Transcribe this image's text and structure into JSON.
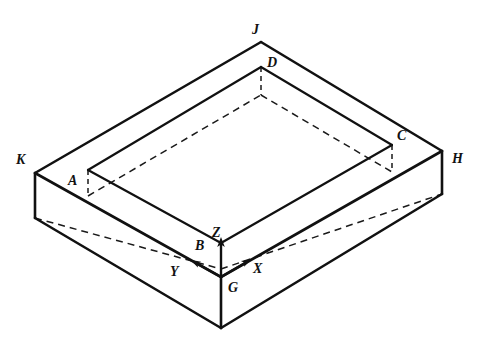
{
  "figure": {
    "kind": "isometric-line-drawing",
    "background_color": "#ffffff",
    "line_color": "#111111",
    "hidden_line_style": "dashed"
  },
  "vertex_labels": [
    {
      "id": "J",
      "text": "J",
      "x": 252,
      "y": 23
    },
    {
      "id": "D",
      "text": "D",
      "x": 267,
      "y": 56
    },
    {
      "id": "C",
      "text": "C",
      "x": 397,
      "y": 129
    },
    {
      "id": "H",
      "text": "H",
      "x": 452,
      "y": 152
    },
    {
      "id": "K",
      "text": "K",
      "x": 16,
      "y": 153
    },
    {
      "id": "A",
      "text": "A",
      "x": 68,
      "y": 174
    },
    {
      "id": "Z",
      "text": "Z",
      "x": 212,
      "y": 226
    },
    {
      "id": "B",
      "text": "B",
      "x": 195,
      "y": 239
    },
    {
      "id": "G",
      "text": "G",
      "x": 228,
      "y": 281
    }
  ],
  "axis_labels": [
    {
      "id": "X",
      "text": "X",
      "x": 253,
      "y": 262
    },
    {
      "id": "Y",
      "text": "Y",
      "x": 170,
      "y": 265
    },
    {
      "id": "Z",
      "text": "Z",
      "x": 212,
      "y": 226
    }
  ],
  "axes": {
    "origin_point": "G",
    "z_direction": "up",
    "x_direction": "right-and-up",
    "y_direction": "left-and-up",
    "arrow_count": 3
  },
  "geometry": {
    "outer_top_face": [
      {
        "name": "K",
        "x": 35,
        "y": 173
      },
      {
        "name": "J",
        "x": 261,
        "y": 42
      },
      {
        "name": "H",
        "x": 442,
        "y": 151
      },
      {
        "name": "G",
        "x": 221,
        "y": 277
      }
    ],
    "inner_rim_top_face": [
      {
        "name": "A",
        "x": 88,
        "y": 170
      },
      {
        "name": "D",
        "x": 261,
        "y": 67
      },
      {
        "name": "C",
        "x": 392,
        "y": 145
      },
      {
        "name": "B",
        "x": 221,
        "y": 243
      }
    ],
    "outer_bottom_visible": [
      {
        "name": "K_low",
        "x": 35,
        "y": 218
      },
      {
        "name": "G_low",
        "x": 221,
        "y": 328
      },
      {
        "name": "H_low",
        "x": 442,
        "y": 194
      }
    ],
    "hidden_cavity_floor": [
      {
        "name": "A_low",
        "x": 88,
        "y": 196
      },
      {
        "name": "D_low",
        "x": 261,
        "y": 93
      },
      {
        "name": "C_low",
        "x": 392,
        "y": 171
      },
      {
        "name": "B_low",
        "x": 221,
        "y": 269
      }
    ]
  }
}
